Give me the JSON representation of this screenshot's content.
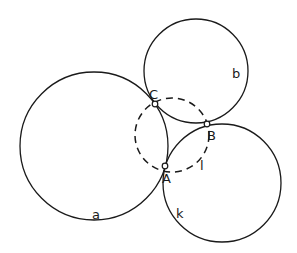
{
  "diagram": {
    "type": "geometry",
    "circles": [
      {
        "id": "a",
        "label": "a",
        "cx": 94,
        "cy": 146,
        "r": 74,
        "style": "solid",
        "label_x": 92,
        "label_y": 219
      },
      {
        "id": "b",
        "label": "b",
        "cx": 196,
        "cy": 71,
        "r": 52,
        "style": "solid",
        "label_x": 232,
        "label_y": 78
      },
      {
        "id": "k",
        "label": "k",
        "cx": 222,
        "cy": 183,
        "r": 59,
        "style": "solid",
        "label_x": 176,
        "label_y": 218
      },
      {
        "id": "l",
        "label": "l",
        "cx": 172,
        "cy": 135,
        "r": 37,
        "style": "dashed",
        "label_x": 200,
        "label_y": 170
      }
    ],
    "points": [
      {
        "id": "A",
        "label": "A",
        "x": 165,
        "y": 166,
        "label_x": 162,
        "label_y": 183
      },
      {
        "id": "B",
        "label": "B",
        "x": 207,
        "y": 124,
        "label_x": 207,
        "label_y": 140
      },
      {
        "id": "C",
        "label": "C",
        "x": 155,
        "y": 104,
        "label_x": 149,
        "label_y": 99
      }
    ],
    "stroke_color": "#1a1a1a",
    "background": "#ffffff"
  }
}
